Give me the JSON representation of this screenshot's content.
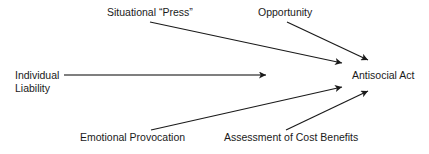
{
  "diagram": {
    "type": "causal-flow",
    "target": {
      "id": "antisocial-act",
      "label": "Antisocial Act"
    },
    "nodes": [
      {
        "id": "situational-press",
        "label": "Situational “Press”"
      },
      {
        "id": "opportunity",
        "label": "Opportunity"
      },
      {
        "id": "individual-liability",
        "label_line1": "Individual",
        "label_line2": "Liability"
      },
      {
        "id": "emotional-provocation",
        "label": "Emotional Provocation"
      },
      {
        "id": "assessment-cost-benefits",
        "label": "Assessment of Cost Benefits"
      }
    ],
    "edges": [
      {
        "from": "situational-press",
        "to": "antisocial-act"
      },
      {
        "from": "opportunity",
        "to": "antisocial-act"
      },
      {
        "from": "individual-liability",
        "to": "antisocial-act"
      },
      {
        "from": "emotional-provocation",
        "to": "antisocial-act"
      },
      {
        "from": "assessment-cost-benefits",
        "to": "antisocial-act"
      }
    ],
    "colors": {
      "line": "#1a1a1a",
      "text": "#1a1a1a",
      "background": "#ffffff"
    }
  }
}
